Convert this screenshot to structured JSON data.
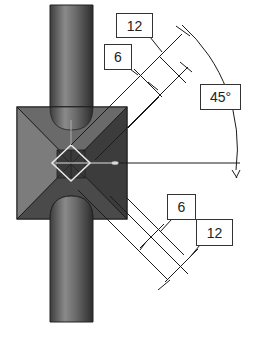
{
  "diagram": {
    "colors": {
      "rod_dark": "#3a3a3a",
      "rod_light": "#9a9a9a",
      "block_dark": "#2e2e2e",
      "block_mid": "#555555",
      "block_light": "#7a7a7a",
      "line": "#1a1a1a",
      "marker": "#e6e6e6"
    },
    "labels": {
      "upper_outer": "12",
      "upper_inner": "6",
      "angle": "45°",
      "lower_inner": "6",
      "lower_outer": "12"
    },
    "axis_marker": "H"
  }
}
